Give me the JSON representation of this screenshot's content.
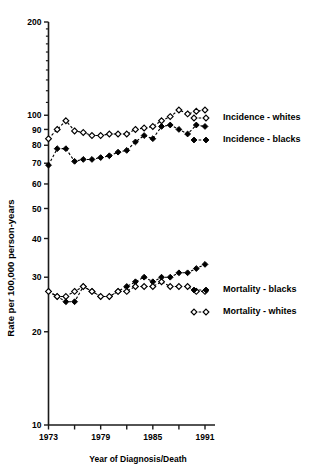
{
  "chart_data": {
    "type": "line",
    "title": "",
    "xlabel": "Year of Diagnosis/Death",
    "ylabel": "Rate per 100,000 person-years",
    "yscale": "log",
    "ylim": [
      10,
      200
    ],
    "xlim": [
      1973,
      1991
    ],
    "grid": false,
    "legend_position": "right",
    "y_tick_labels": [
      "200",
      "100",
      "90",
      "80",
      "70",
      "60",
      "50",
      "40",
      "30",
      "20",
      "10"
    ],
    "y_tick_values": [
      200,
      100,
      90,
      80,
      70,
      60,
      50,
      40,
      30,
      20,
      10
    ],
    "x_tick_values": [
      1973,
      1976,
      1979,
      1982,
      1985,
      1988,
      1991
    ],
    "x_tick_labels": [
      "1973",
      "",
      "1979",
      "",
      "1985",
      "",
      "1991"
    ],
    "x_all_years": [
      1973,
      1974,
      1975,
      1976,
      1977,
      1978,
      1979,
      1980,
      1981,
      1982,
      1983,
      1984,
      1985,
      1986,
      1987,
      1988,
      1989,
      1990,
      1991
    ],
    "series": [
      {
        "name": "Incidence - whites",
        "marker": "open-diamond",
        "line": "dashed",
        "values": [
          84,
          90,
          96,
          89,
          88,
          86,
          86,
          87,
          87,
          87,
          90,
          91,
          92,
          96,
          99,
          104,
          101,
          103,
          104
        ]
      },
      {
        "name": "Incidence - blacks",
        "marker": "filled-diamond",
        "line": "dashed",
        "values": [
          69,
          78,
          78,
          71,
          72,
          72,
          73,
          74,
          76,
          77,
          82,
          86,
          84,
          92,
          93,
          90,
          87,
          93,
          92
        ]
      },
      {
        "name": "Mortality - blacks",
        "marker": "filled-diamond",
        "line": "dashed",
        "values": [
          27,
          26,
          25,
          25,
          28,
          27,
          26,
          26,
          27,
          28,
          29,
          30,
          29,
          30,
          30,
          31,
          31,
          32,
          33
        ]
      },
      {
        "name": "Mortality - whites",
        "marker": "open-diamond",
        "line": "dashed",
        "values": [
          27,
          26,
          26,
          27,
          28,
          27,
          26,
          26,
          27,
          27,
          28,
          28,
          28,
          29,
          28,
          28,
          28,
          27,
          27
        ]
      }
    ]
  },
  "legend": {
    "items": [
      {
        "label": "Incidence - whites",
        "marker": "open-diamond"
      },
      {
        "label": "Incidence - blacks",
        "marker": "filled-diamond"
      },
      {
        "label": "Mortality - blacks",
        "marker": "filled-diamond"
      },
      {
        "label": "Mortality - whites",
        "marker": "open-diamond"
      }
    ]
  },
  "colors": {
    "axis": "#1a1a1a",
    "line": "#000000",
    "marker_fill_open": "#ffffff",
    "marker_fill_solid": "#000000",
    "background": "#ffffff"
  }
}
